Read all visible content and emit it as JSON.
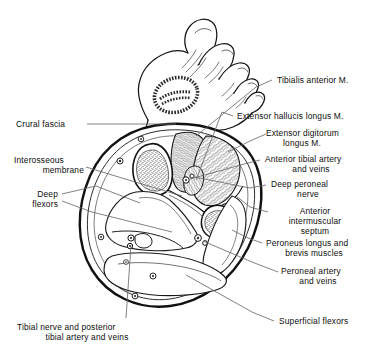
{
  "figure": {
    "view": "transverse section through the leg, foot shown in dorsal perspective above",
    "background_color": "#ffffff",
    "ink_color": "#111111",
    "line_color": "#3a3a3a"
  },
  "labels": {
    "tibialis_anterior": "Tibialis anterior M.",
    "extensor_hallucis_longus": "Extensor hallucis longus M.",
    "extensor_digitorum_longus_l1": "Extensor digitorum",
    "extensor_digitorum_longus_l2": "longus M.",
    "anterior_tibial_vessels_l1": "Anterior tibial artery",
    "anterior_tibial_vessels_l2": "and veins",
    "deep_peroneal_nerve_l1": "Deep peroneal",
    "deep_peroneal_nerve_l2": "nerve",
    "anterior_intermuscular_septum_l1": "Anterior",
    "anterior_intermuscular_septum_l2": "intermuscular",
    "anterior_intermuscular_septum_l3": "septum",
    "peroneus_muscles_l1": "Peroneus longus and",
    "peroneus_muscles_l2": "brevis muscles",
    "peroneal_vessels_l1": "Peroneal artery",
    "peroneal_vessels_l2": "and veins",
    "superficial_flexors": "Superficial flexors",
    "crural_fascia": "Crural fascia",
    "interosseous_membrane_l1": "Interosseous",
    "interosseous_membrane_l2": "membrane",
    "deep_flexors_l1": "Deep",
    "deep_flexors_l2": "flexors",
    "tibial_nerve_vessels_l1": "Tibial nerve and posterior",
    "tibial_nerve_vessels_l2": "tibial artery and veins"
  },
  "structures": {
    "tibia": "tibia (stippled cancellous bone, anteromedial)",
    "fibula": "fibula (stippled cancellous bone, lateral)",
    "anterior_compartment": "anterior compartment muscles (hatched)",
    "lateral_compartment": "lateral compartment (peroneal) muscles",
    "deep_posterior_compartment": "deep posterior flexor muscles",
    "superficial_posterior_compartment": "superficial posterior flexor muscles",
    "crural_fascia_ring": "investing crural fascia outer ring",
    "interosseous_membrane": "interosseous membrane between tibia and fibula",
    "foot": "dorsum of foot with five toes and hatched oval marking section level"
  }
}
